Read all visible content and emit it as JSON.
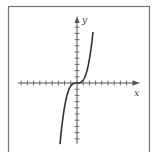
{
  "chart_data": {
    "type": "line",
    "title": "",
    "xlabel": "x",
    "ylabel": "y",
    "function": "y = x^3",
    "x": [
      -2.4,
      -2.0,
      -1.5,
      -1.0,
      -0.5,
      0,
      0.5,
      1.0,
      1.5,
      2.0,
      2.6
    ],
    "series": [
      {
        "name": "y = x^3",
        "values": [
          -13.8,
          -8.0,
          -3.4,
          -1.0,
          -0.1,
          0,
          0.1,
          1.0,
          3.4,
          8.0,
          17.6
        ]
      }
    ],
    "xlim": [
      -9,
      9
    ],
    "ylim": [
      -10,
      10
    ],
    "grid": false,
    "legend": "none",
    "x_ticks_each_side": 9,
    "y_ticks_each_side": 10,
    "axis_arrows": true
  },
  "colors": {
    "axis": "#555555",
    "curve": "#333333",
    "frame": "#777777",
    "background": "#ffffff"
  },
  "labels": {
    "x_axis": "x",
    "y_axis": "y"
  }
}
